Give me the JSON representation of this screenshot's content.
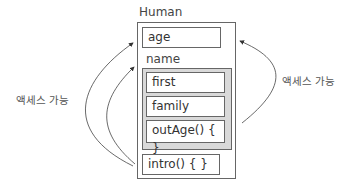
{
  "diagram": {
    "object": {
      "title": "Human",
      "members": [
        {
          "name": "age"
        },
        {
          "name": "intro() { }"
        }
      ],
      "nested": {
        "title": "name",
        "members": [
          {
            "name": "first"
          },
          {
            "name": "family"
          },
          {
            "name": "outAge() { }"
          }
        ]
      }
    },
    "annotations": {
      "left": "액세스 가능",
      "right": "액세스 가능"
    }
  }
}
